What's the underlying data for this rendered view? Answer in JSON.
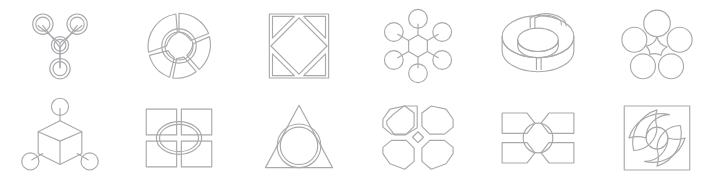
{
  "sheet": {
    "title": "Abstract geometric infographic icon sheet",
    "width": 717,
    "height": 184,
    "background_color": "#ffffff",
    "stroke_color": "#a9a9ad",
    "stroke_width": 1.15,
    "columns": 6,
    "rows": 2,
    "icon_count": 12
  },
  "icons": [
    {
      "index": 1,
      "row": 1,
      "column": 1,
      "name": "trinode-molecule-icon",
      "label": "Three-node molecule hub",
      "description": "Three outer rings joined by a Y-shaped connector to a central ring",
      "element_counts": {
        "outer_circles": 3,
        "center_circles": 1,
        "connectors": 3
      }
    },
    {
      "index": 2,
      "row": 1,
      "column": 2,
      "name": "segmented-donut-icon",
      "label": "Segmented donut chart",
      "description": "Ring divided into five arc segments around a hollow center circle",
      "element_counts": {
        "segments": 5,
        "center_circles": 1
      }
    },
    {
      "index": 3,
      "row": 1,
      "column": 3,
      "name": "square-in-diamond-icon",
      "label": "Square with inscribed diamond",
      "description": "Outer square containing a rotated square, forming four corner triangles",
      "element_counts": {
        "squares": 1,
        "diamonds": 1,
        "corner_triangles": 4
      }
    },
    {
      "index": 4,
      "row": 1,
      "column": 4,
      "name": "hexagon-hub-spoke-icon",
      "label": "Six-spoke hub and node diagram",
      "description": "Central hexagon linked by six short spokes to six satellite circles",
      "element_counts": {
        "satellite_circles": 6,
        "spokes": 6,
        "hub_polygons": 1
      }
    },
    {
      "index": 5,
      "row": 1,
      "column": 5,
      "name": "isometric-donut-icon",
      "label": "3D isometric split donut",
      "description": "Extruded torus ring shown in isometric view, split into raised sectors",
      "element_counts": {
        "sectors": 3,
        "rings": 2
      }
    },
    {
      "index": 6,
      "row": 1,
      "column": 6,
      "name": "five-circle-rosette-icon",
      "label": "Five-circle rosette cluster",
      "description": "Five rings arranged in a pentagon with a concave star gap at center",
      "element_counts": {
        "circles": 5,
        "center_shapes": 1
      }
    },
    {
      "index": 7,
      "row": 2,
      "column": 1,
      "name": "cube-three-node-icon",
      "label": "Isometric cube with three nodes",
      "description": "Isometric cube linked by stems to circles at top, lower-left and lower-right",
      "element_counts": {
        "cubes": 1,
        "circles": 3,
        "stems": 3
      }
    },
    {
      "index": 8,
      "row": 2,
      "column": 2,
      "name": "quad-panel-ellipse-icon",
      "label": "Four panels with central ellipse",
      "description": "Two-by-two grid of rectangles overlapped by a double-outlined center ellipse",
      "element_counts": {
        "panels": 4,
        "ellipses": 2
      }
    },
    {
      "index": 9,
      "row": 2,
      "column": 3,
      "name": "triangle-circle-icon",
      "label": "Triangle with overlapping circle",
      "description": "Equilateral triangle with a double-outlined circle breaking past its base",
      "element_counts": {
        "triangles": 1,
        "circles": 2
      }
    },
    {
      "index": 10,
      "row": 2,
      "column": 4,
      "name": "quad-octagon-icon",
      "label": "Four octagons with center diamond",
      "description": "Four octagons in a two-by-two cluster meeting at a small diamond",
      "element_counts": {
        "octagons": 4,
        "diamonds": 1
      }
    },
    {
      "index": 11,
      "row": 2,
      "column": 5,
      "name": "four-banner-circle-icon",
      "label": "Four banners around a circle",
      "description": "Four notched banner blocks pointing inward at a central circle",
      "element_counts": {
        "banners": 4,
        "circles": 1
      }
    },
    {
      "index": 12,
      "row": 2,
      "column": 6,
      "name": "pinwheel-swirl-square-icon",
      "label": "Pinwheel swirl in a square",
      "description": "Square frame enclosing a four-blade curved pinwheel with a center circle",
      "element_counts": {
        "squares": 1,
        "blades": 4,
        "circles": 1
      }
    }
  ]
}
